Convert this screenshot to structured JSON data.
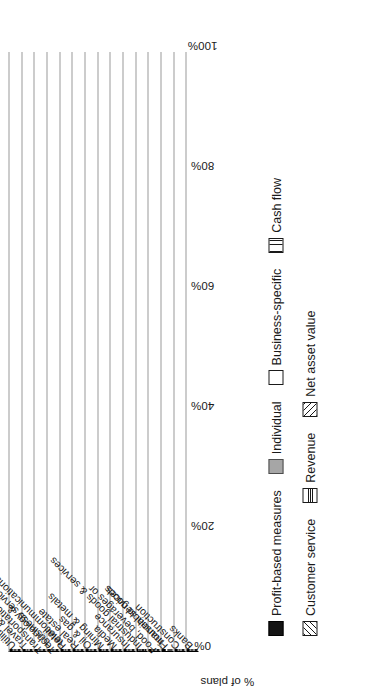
{
  "chart_data": {
    "type": "bar",
    "orientation": "horizontal-grouped",
    "title": "",
    "xlabel": "% of plans",
    "ylabel": "",
    "xlim": [
      0,
      100
    ],
    "xticks": [
      "0%",
      "20%",
      "40%",
      "60%",
      "80%",
      "100%"
    ],
    "xtick_values": [
      0,
      20,
      40,
      60,
      80,
      100
    ],
    "grid": false,
    "legend_position": "below",
    "categories": [
      "Banks",
      "Construction",
      "Financial services",
      "Food, beverages or household goods",
      "Industrial goods & services",
      "Insurance",
      "Media",
      "Mining & metals",
      "Oil & gas",
      "Real estate",
      "Retail",
      "Technology & telecommunications",
      "Transportation & business services",
      "Travel & leisure",
      "Utilities"
    ],
    "series": [
      {
        "name": "Profit-based measures",
        "fill": "solid-black",
        "color": "#141414",
        "values": [
          100,
          88,
          96,
          94,
          70,
          85,
          81,
          91,
          57,
          50,
          62,
          96,
          79,
          87,
          74
        ]
      },
      {
        "name": "Individual",
        "fill": "solid-gray",
        "color": "#a6a6a6",
        "values": [
          64,
          42,
          27,
          51,
          33,
          55,
          47,
          40,
          55,
          61,
          43,
          28,
          35,
          63,
          65
        ]
      },
      {
        "name": "Business-specific",
        "fill": "white",
        "color": "#ffffff",
        "values": [
          0,
          0,
          0,
          48,
          30,
          38,
          0,
          43,
          38,
          0,
          36,
          0,
          0,
          45,
          0
        ]
      },
      {
        "name": "Cash flow",
        "fill": "vertical-lines",
        "color": "#ffffff",
        "values": [
          0,
          0,
          0,
          0,
          0,
          0,
          0,
          0,
          0,
          0,
          0,
          0,
          0,
          0,
          0
        ]
      },
      {
        "name": "Customer service",
        "fill": "diagonal-back",
        "color": "#ffffff",
        "values": [
          31,
          25,
          0,
          0,
          0,
          0,
          0,
          0,
          0,
          0,
          0,
          0,
          0,
          0,
          0
        ]
      },
      {
        "name": "Revenue",
        "fill": "horizontal-lines",
        "color": "#ffffff",
        "values": [
          0,
          0,
          0,
          0,
          46,
          0,
          29,
          0,
          0,
          0,
          0,
          30,
          0,
          0,
          0
        ]
      },
      {
        "name": "Net asset value",
        "fill": "diagonal-fwd",
        "color": "#ffffff",
        "values": [
          0,
          0,
          0,
          0,
          0,
          0,
          0,
          0,
          0,
          40,
          0,
          0,
          28,
          0,
          52
        ]
      }
    ],
    "legend_rows": [
      [
        "Profit-based measures",
        "Individual",
        "Business-specific",
        "Cash flow"
      ],
      [
        "Customer service",
        "Revenue",
        "Net asset value"
      ]
    ]
  }
}
